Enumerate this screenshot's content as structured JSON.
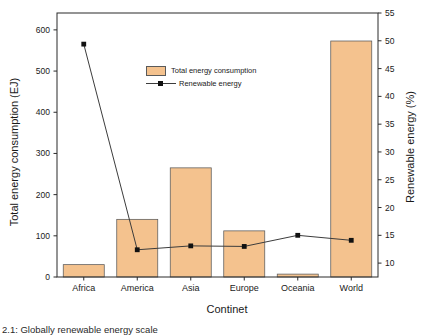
{
  "figure": {
    "caption": "2.1: Globally renewable energy scale"
  },
  "chart_data": {
    "type": "bar",
    "subtype": "dual-axis bar + line",
    "categories": [
      "Africa",
      "America",
      "Asia",
      "Europe",
      "Oceania",
      "World"
    ],
    "series": [
      {
        "name": "Total energy consumption",
        "type": "bar",
        "axis": "left",
        "values": [
          30,
          140,
          265,
          112,
          7,
          573
        ]
      },
      {
        "name": "Renewable energy",
        "type": "line",
        "axis": "right",
        "values": [
          49.4,
          12.4,
          13.1,
          13.0,
          15.0,
          14.1
        ]
      }
    ],
    "xlabel": "Continet",
    "ylabel_left": "Total energy consumption (EJ)",
    "ylabel_right": "Renewable energy (%)",
    "yticks_left": [
      0,
      100,
      200,
      300,
      400,
      500,
      600
    ],
    "yticks_right": [
      10,
      15,
      20,
      25,
      30,
      35,
      40,
      45,
      50,
      55
    ],
    "ylim_left": [
      0,
      641
    ],
    "ylim_right": [
      7.5,
      55
    ],
    "grid": false,
    "legend_position": "upper-center-left, no frame",
    "colors": {
      "bar_fill": "#f4c28e",
      "bar_edge": "#5a5a5a",
      "line": "#3c3c3c",
      "marker": "#111111",
      "spine": "#2b2b2b",
      "text": "#1a1a1a"
    }
  }
}
